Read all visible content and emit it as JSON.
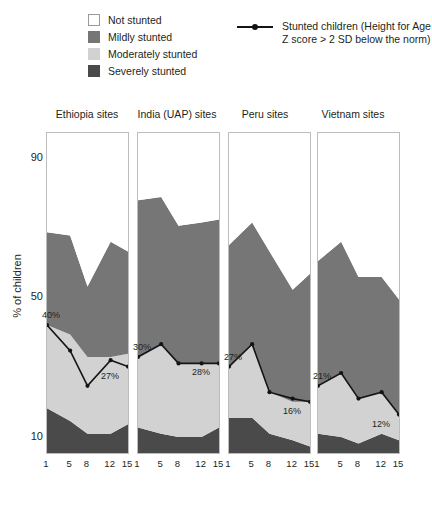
{
  "legend": {
    "categories": [
      {
        "label": "Not stunted",
        "color": "#ffffff",
        "border": "#9a9a9a"
      },
      {
        "label": "Mildly stunted",
        "color": "#767676",
        "border": "#767676"
      },
      {
        "label": "Moderately stunted",
        "color": "#d2d2d2",
        "border": "#d2d2d2"
      },
      {
        "label": "Severely stunted",
        "color": "#4a4a4a",
        "border": "#4a4a4a"
      }
    ],
    "line_series_label": "Stunted children (Height for Age Z score > 2 SD below the norm)",
    "line_color": "#141414"
  },
  "axes": {
    "ylabel": "% of children",
    "yticks": [
      90,
      50,
      10
    ],
    "ylim": [
      0,
      100
    ],
    "xticks": [
      1,
      5,
      8,
      12,
      15
    ]
  },
  "chart_data": {
    "type": "area",
    "title": "",
    "xlabel": "",
    "ylabel": "% of children",
    "ylim": [
      0,
      100
    ],
    "grid": false,
    "legend_position": "top",
    "stack_order": [
      "Severely stunted",
      "Moderately stunted",
      "Mildly stunted",
      "Not stunted"
    ],
    "x": [
      1,
      5,
      8,
      12,
      15
    ],
    "panels": [
      {
        "name": "Ethiopia sites",
        "series": [
          {
            "name": "Severely stunted",
            "values": [
              14,
              10,
              6,
              6,
              9
            ]
          },
          {
            "name": "Moderately stunted",
            "values": [
              26,
              27,
              24,
              24,
              22
            ]
          },
          {
            "name": "Mildly stunted",
            "values": [
              29,
              31,
              22,
              36,
              32
            ]
          },
          {
            "name": "Not stunted",
            "values": [
              31,
              32,
              48,
              34,
              37
            ]
          }
        ],
        "line": {
          "name": "Stunted children",
          "values": [
            40,
            32,
            21,
            29,
            27
          ],
          "labels": [
            {
              "x": 1,
              "value": 40,
              "text": "40%"
            },
            {
              "x": 15,
              "value": 27,
              "text": "27%"
            }
          ]
        }
      },
      {
        "name": "India (UAP) sites",
        "series": [
          {
            "name": "Severely stunted",
            "values": [
              8,
              6,
              5,
              5,
              8
            ]
          },
          {
            "name": "Moderately stunted",
            "values": [
              22,
              28,
              23,
              23,
              20
            ]
          },
          {
            "name": "Mildly stunted",
            "values": [
              49,
              46,
              43,
              44,
              45
            ]
          },
          {
            "name": "Not stunted",
            "values": [
              21,
              20,
              29,
              28,
              27
            ]
          }
        ],
        "line": {
          "name": "Stunted children",
          "values": [
            30,
            34,
            28,
            28,
            28
          ],
          "labels": [
            {
              "x": 1,
              "value": 30,
              "text": "30%"
            },
            {
              "x": 15,
              "value": 28,
              "text": "28%"
            }
          ]
        }
      },
      {
        "name": "Peru sites",
        "series": [
          {
            "name": "Severely stunted",
            "values": [
              11,
              11,
              6,
              4,
              2
            ]
          },
          {
            "name": "Moderately stunted",
            "values": [
              16,
              23,
              13,
              12,
              14
            ]
          },
          {
            "name": "Mildly stunted",
            "values": [
              38,
              38,
              44,
              35,
              40
            ]
          },
          {
            "name": "Not stunted",
            "values": [
              35,
              28,
              37,
              49,
              44
            ]
          }
        ],
        "line": {
          "name": "Stunted children",
          "values": [
            27,
            34,
            19,
            17,
            16
          ],
          "labels": [
            {
              "x": 1,
              "value": 27,
              "text": "27%"
            },
            {
              "x": 15,
              "value": 16,
              "text": "16%"
            }
          ]
        }
      },
      {
        "name": "Vietnam sites",
        "series": [
          {
            "name": "Severely stunted",
            "values": [
              6,
              5,
              3,
              6,
              4
            ]
          },
          {
            "name": "Moderately stunted",
            "values": [
              15,
              20,
              14,
              13,
              8
            ]
          },
          {
            "name": "Mildly stunted",
            "values": [
              39,
              41,
              38,
              36,
              36
            ]
          },
          {
            "name": "Not stunted",
            "values": [
              40,
              34,
              45,
              45,
              52
            ]
          }
        ],
        "line": {
          "name": "Stunted children",
          "values": [
            21,
            25,
            17,
            19,
            12
          ],
          "labels": [
            {
              "x": 1,
              "value": 21,
              "text": "21%"
            },
            {
              "x": 15,
              "value": 12,
              "text": "12%"
            }
          ]
        }
      }
    ]
  }
}
